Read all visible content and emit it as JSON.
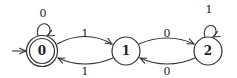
{
  "diagram": {
    "type": "finite-state-automaton",
    "states": [
      {
        "id": "0",
        "label": "0",
        "initial": true,
        "accepting": true
      },
      {
        "id": "1",
        "label": "1",
        "initial": false,
        "accepting": false
      },
      {
        "id": "2",
        "label": "2",
        "initial": false,
        "accepting": false
      }
    ],
    "transitions": [
      {
        "from": "0",
        "to": "0",
        "label": "0"
      },
      {
        "from": "0",
        "to": "1",
        "label": "1"
      },
      {
        "from": "1",
        "to": "0",
        "label": "1"
      },
      {
        "from": "1",
        "to": "2",
        "label": "0"
      },
      {
        "from": "2",
        "to": "1",
        "label": "0"
      },
      {
        "from": "2",
        "to": "2",
        "label": "1"
      }
    ]
  }
}
